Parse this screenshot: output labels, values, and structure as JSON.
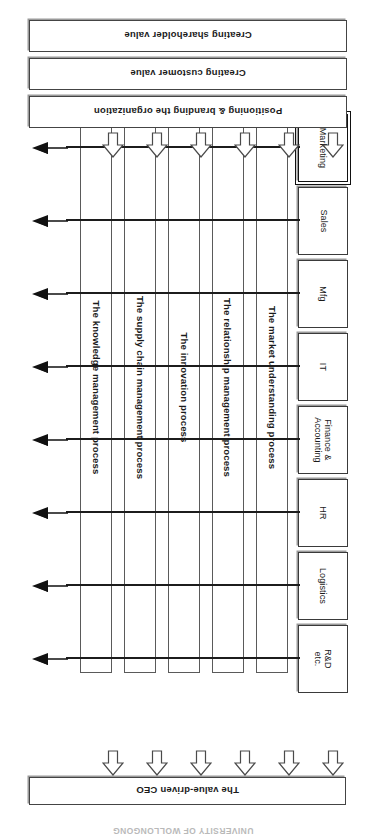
{
  "figure": {
    "title": "UNIVERSITY OF WOLLONGONG",
    "ceo_banner": {
      "label": "The value-driven CEO"
    },
    "value_banners": [
      {
        "label": "Positioning & branding the organization"
      },
      {
        "label": "Creating customer value"
      },
      {
        "label": "Creating shareholder value"
      }
    ],
    "departments": [
      {
        "label": "Marketing",
        "highlight": true
      },
      {
        "label": "Sales",
        "highlight": false
      },
      {
        "label": "Mfg",
        "highlight": false
      },
      {
        "label": "IT",
        "highlight": false
      },
      {
        "label": "Finance &\nAccounting",
        "highlight": false
      },
      {
        "label": "HR",
        "highlight": false
      },
      {
        "label": "Logistics",
        "highlight": false
      },
      {
        "label": "R&D\netc.",
        "highlight": false
      }
    ],
    "processes": [
      {
        "label": "The market understanding process"
      },
      {
        "label": "The relationship management process"
      },
      {
        "label": "The innovation process"
      },
      {
        "label": "The supply chain management process"
      },
      {
        "label": "The knowledge management process"
      }
    ],
    "arrow_counts": {
      "hollow_to_departments": 6,
      "hollow_to_value_banners": 6,
      "solid_outputs": 8
    },
    "colors": {
      "line": "#3a3a3a",
      "shadow": "#9a9a9a",
      "arrow_fill": "#111111",
      "background": "#ffffff"
    }
  }
}
